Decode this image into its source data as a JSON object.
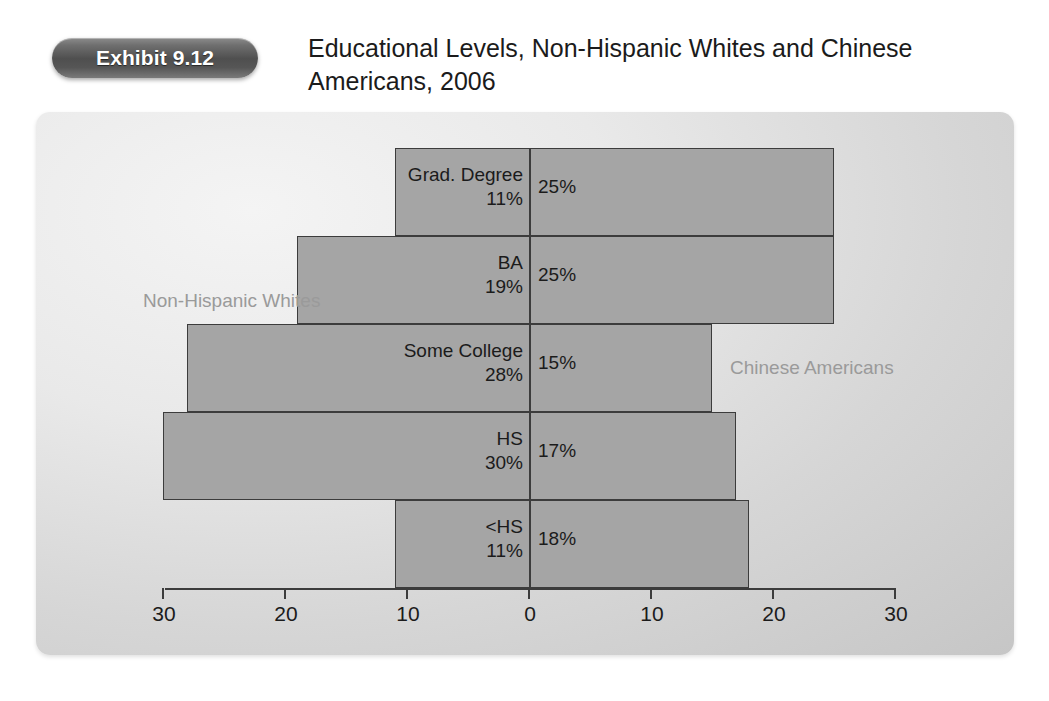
{
  "exhibit": {
    "badge_label": "Exhibit 9.12",
    "title": "Educational Levels, Non-Hispanic Whites and Chinese Americans, 2006"
  },
  "chart_data": {
    "type": "bar",
    "orientation": "horizontal-diverging",
    "title": "Educational Levels, Non-Hispanic Whites and Chinese Americans, 2006",
    "xlabel": "",
    "ylabel": "",
    "categories": [
      "Grad. Degree",
      "BA",
      "Some College",
      "HS",
      "<HS"
    ],
    "series": [
      {
        "name": "Non-Hispanic Whites",
        "side": "left",
        "values": [
          11,
          19,
          28,
          30,
          11
        ],
        "labels": [
          "11%",
          "19%",
          "28%",
          "30%",
          "11%"
        ]
      },
      {
        "name": "Chinese Americans",
        "side": "right",
        "values": [
          25,
          25,
          15,
          17,
          18
        ],
        "labels": [
          "25%",
          "25%",
          "15%",
          "17%",
          "18%"
        ]
      }
    ],
    "axis_ticks": [
      {
        "label": "30",
        "value": -30
      },
      {
        "label": "20",
        "value": -20
      },
      {
        "label": "10",
        "value": -10
      },
      {
        "label": "0",
        "value": 0
      },
      {
        "label": "10",
        "value": 10
      },
      {
        "label": "20",
        "value": 20
      },
      {
        "label": "30",
        "value": 30
      }
    ],
    "xlim": [
      -30,
      30
    ],
    "grid": false,
    "legend_position": "in-plot-annotations",
    "colors": {
      "bar_fill": "#a5a5a5",
      "bar_border": "#3c3c3c",
      "panel_background": "#dcdcdc",
      "series_label": "#9a9a9a",
      "badge_background": "#565656",
      "text": "#1b1b1b"
    }
  }
}
